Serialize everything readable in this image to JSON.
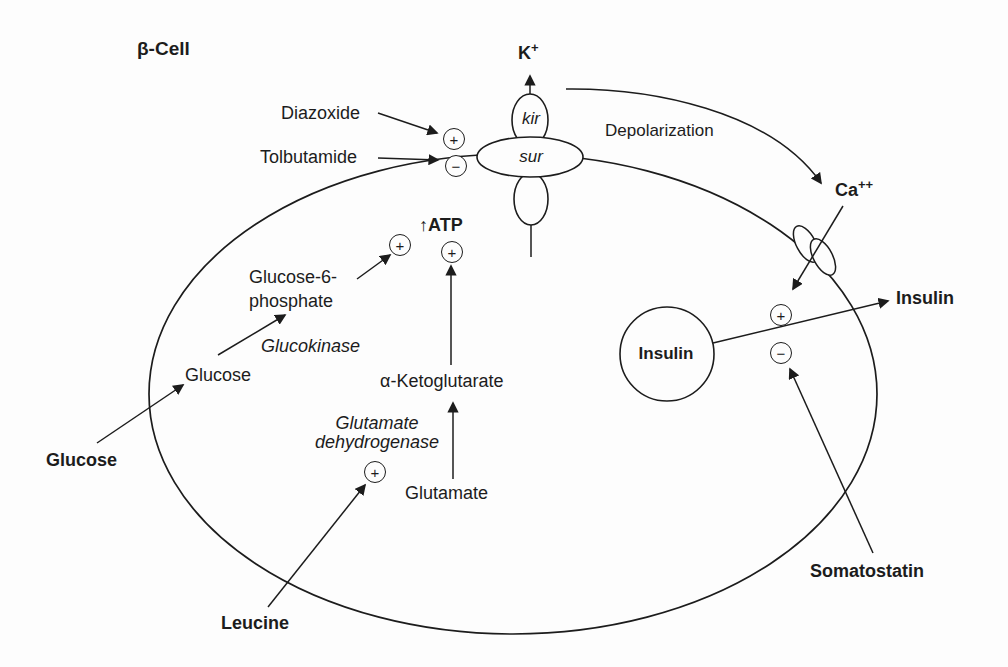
{
  "colors": {
    "ink": "#1c1c1c",
    "background": "#fdfdfd"
  },
  "cell": {
    "name_label": "β-Cell"
  },
  "ions": {
    "potassium_base": "K",
    "potassium_sup": "+",
    "calcium_base": "Ca",
    "calcium_sup": "++"
  },
  "membrane_channels": {
    "kir_label": "kir",
    "sur_label": "sur"
  },
  "drugs": {
    "diazoxide": "Diazoxide",
    "tolbutamide": "Tolbutamide",
    "somatostatin": "Somatostatin"
  },
  "processes": {
    "depolarization": "Depolarization"
  },
  "metabolites": {
    "glucose_extracellular": "Glucose",
    "glucose_intracellular": "Glucose",
    "glucose6phosphate_line1": "Glucose-6-",
    "glucose6phosphate_line2": "phosphate",
    "atp": "↑ATP",
    "alpha_ketoglutarate": "α-Ketoglutarate",
    "glutamate": "Glutamate",
    "leucine": "Leucine"
  },
  "enzymes": {
    "glucokinase": "Glucokinase",
    "glutamate_dehydrogenase_line1": "Glutamate",
    "glutamate_dehydrogenase_line2": "dehydrogenase"
  },
  "hormones": {
    "insulin_vesicle": "Insulin",
    "insulin_secreted": "Insulin"
  },
  "signs": {
    "plus": "+",
    "minus": "−"
  }
}
